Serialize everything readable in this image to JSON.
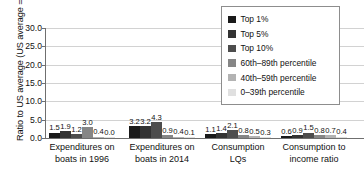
{
  "chart_data": {
    "type": "bar",
    "title": "",
    "xlabel": "",
    "ylabel": "Ratio to US average (US average = 1.0)",
    "ylim": [
      0.0,
      30.0
    ],
    "ytick_labels": [
      "0.0",
      "5.0",
      "10.0",
      "15.0",
      "20.0",
      "25.0",
      "30.0"
    ],
    "ytick_values": [
      0,
      5,
      10,
      15,
      20,
      25,
      30
    ],
    "grid": true,
    "legend_position": "top-right",
    "categories": [
      "Expenditures on boats in 1996",
      "Expenditures on boats in 2014",
      "Consumption LQs",
      "Consumption to income ratio"
    ],
    "category_lines": [
      [
        "Expenditures on",
        "boats in 1996"
      ],
      [
        "Expenditures on",
        "boats in 2014"
      ],
      [
        "Consumption",
        "LQs"
      ],
      [
        "Consumption to",
        "income ratio"
      ]
    ],
    "series": [
      {
        "name": "Top 1%",
        "color": "#1a1a1a",
        "values": [
          1.5,
          3.2,
          1.1,
          0.6
        ],
        "labels": [
          "1.5",
          "3.2",
          "1.1",
          "0.6"
        ]
      },
      {
        "name": "Top 5%",
        "color": "#333333",
        "values": [
          1.9,
          3.2,
          1.4,
          0.9
        ],
        "labels": [
          "1.9",
          "3.2",
          "1.4",
          "0.9"
        ]
      },
      {
        "name": "Top 10%",
        "color": "#4d4d4d",
        "values": [
          1.2,
          4.3,
          2.1,
          1.5
        ],
        "labels": [
          "1.2",
          "4.3",
          "2.1",
          "1.5"
        ]
      },
      {
        "name": "60th–89th percentile",
        "color": "#868686",
        "values": [
          3.0,
          0.9,
          0.8,
          0.8
        ],
        "labels": [
          "3.0",
          "0.9",
          "0.8",
          "0.8"
        ]
      },
      {
        "name": "40th–59th percentile",
        "color": "#b3b3b3",
        "values": [
          0.4,
          0.4,
          0.5,
          0.7
        ],
        "labels": [
          "0.4",
          "0.4",
          "0.5",
          "0.7"
        ]
      },
      {
        "name": "0–39th percentile",
        "color": "#e0e0e0",
        "values": [
          0.0,
          0.1,
          0.3,
          0.4
        ],
        "labels": [
          "0.0",
          "0.1",
          "0.3",
          "0.4"
        ]
      }
    ]
  }
}
